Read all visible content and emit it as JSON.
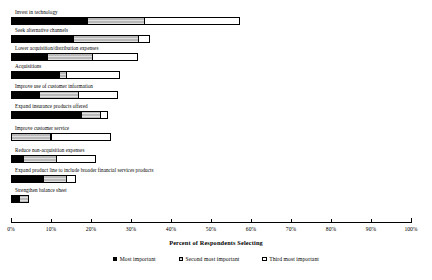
{
  "chart_data": {
    "type": "bar",
    "orientation": "horizontal",
    "stacked": true,
    "title": "",
    "xlabel": "Percent of Respondents Selecting",
    "ylabel": "",
    "xlim": [
      0,
      100
    ],
    "xtick_labels": [
      "0%",
      "10%",
      "20%",
      "30%",
      "40%",
      "50%",
      "60%",
      "70%",
      "80%",
      "90%",
      "100%"
    ],
    "xticks": [
      0,
      10,
      20,
      30,
      40,
      50,
      60,
      70,
      80,
      90,
      100
    ],
    "grid": false,
    "legend_position": "bottom",
    "legend": [
      "Most important",
      "Second most important",
      "Third most important"
    ],
    "categories": [
      "Invest in technology",
      "Seek alternative channels",
      "Lower acquisition/distribution expenses",
      "Acquisitions",
      "Improve use of customer information",
      "Expand insurance products offered",
      "Improve customer service",
      "Reduce non-acquisition expenses",
      "Expand product line to include broader financial services products",
      "Strengthen balance sheet"
    ],
    "series": [
      {
        "name": "Most important",
        "color": "#000000",
        "values": [
          19,
          15.5,
          9,
          12,
          7,
          17.5,
          0,
          3,
          8,
          2
        ]
      },
      {
        "name": "Second most important",
        "color": "#b9b9b9",
        "values": [
          14.5,
          16.5,
          11.5,
          2,
          10,
          5,
          10,
          8.5,
          6,
          2.5
        ]
      },
      {
        "name": "Third most important",
        "color": "#ffffff",
        "values": [
          24,
          3,
          11.5,
          13.5,
          10,
          2,
          15,
          10,
          2.5,
          0
        ]
      }
    ],
    "totals": [
      57.5,
      35,
      32,
      27.5,
      27,
      24.5,
      25,
      21.5,
      16.5,
      4.5
    ]
  }
}
